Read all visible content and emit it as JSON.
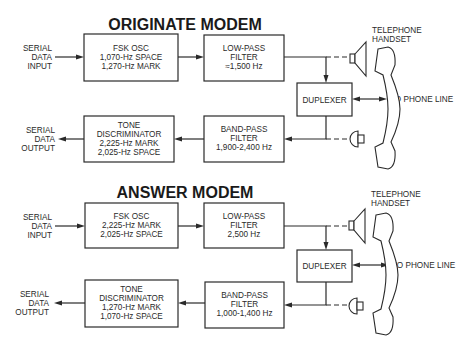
{
  "originate": {
    "title": "ORIGINATE MODEM",
    "input_label": [
      "SERIAL",
      "DATA",
      "INPUT"
    ],
    "output_label": [
      "SERIAL",
      "DATA",
      "OUTPUT"
    ],
    "fsk_osc": [
      "FSK OSC",
      "1,070-Hz SPACE",
      "1,270-Hz MARK"
    ],
    "low_pass": [
      "LOW-PASS",
      "FILTER",
      "≈1,500 Hz"
    ],
    "duplexer": "DUPLEXER",
    "tone_disc": [
      "TONE",
      "DISCRIMINATOR",
      "2,225-Hz MARK",
      "2,025-Hz SPACE"
    ],
    "band_pass": [
      "BAND-PASS",
      "FILTER",
      "1,900-2,400 Hz"
    ],
    "handset_label": [
      "TELEPHONE",
      "HANDSET"
    ],
    "phone_line": "TO PHONE LINE"
  },
  "answer": {
    "title": "ANSWER MODEM",
    "input_label": [
      "SERIAL",
      "DATA",
      "INPUT"
    ],
    "output_label": [
      "SERIAL",
      "DATA",
      "OUTPUT"
    ],
    "fsk_osc": [
      "FSK OSC",
      "2,225-Hz MARK",
      "2,025-Hz SPACE"
    ],
    "low_pass": [
      "LOW-PASS",
      "FILTER",
      "2,500 Hz"
    ],
    "duplexer": "DUPLEXER",
    "tone_disc": [
      "TONE",
      "DISCRIMINATOR",
      "1,270-Hz MARK",
      "1,070-Hz SPACE"
    ],
    "band_pass": [
      "BAND-PASS",
      "FILTER",
      "1,000-1,400 Hz"
    ],
    "handset_label": [
      "TELEPHONE",
      "HANDSET"
    ],
    "phone_line": "TO PHONE LINE"
  },
  "colors": {
    "ink": "#2a2a2a",
    "background": "#ffffff"
  }
}
